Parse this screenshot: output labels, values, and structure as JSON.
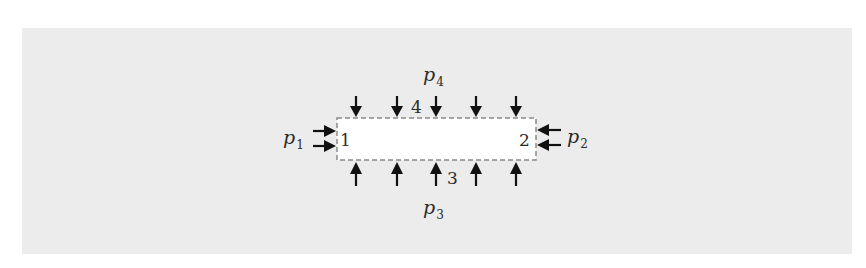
{
  "figure": {
    "background_color": "#ececec",
    "box": {
      "fill": "#ffffff",
      "border_color": "#8a8a8a",
      "border_style": "dashed"
    },
    "arrow_color": "#111111",
    "pressures": [
      {
        "id": "p1",
        "symbol": "p",
        "subscript": "1",
        "side": "left"
      },
      {
        "id": "p2",
        "symbol": "p",
        "subscript": "2",
        "side": "right"
      },
      {
        "id": "p3",
        "symbol": "p",
        "subscript": "3",
        "side": "bottom"
      },
      {
        "id": "p4",
        "symbol": "p",
        "subscript": "4",
        "side": "top"
      }
    ],
    "surface_labels": {
      "left": "1",
      "right": "2",
      "bottom": "3",
      "top": "4"
    },
    "arrow_counts": {
      "top": 5,
      "bottom": 5,
      "left": 2,
      "right": 2
    }
  }
}
